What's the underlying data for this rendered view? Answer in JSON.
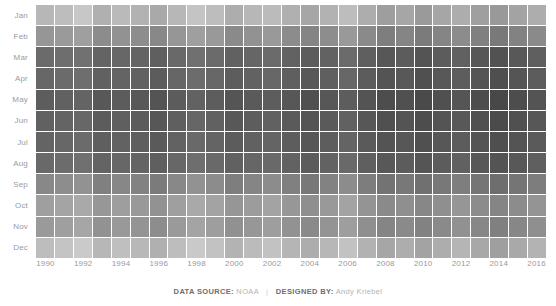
{
  "footer": {
    "source_label": "DATA SOURCE:",
    "source_value": "NOAA",
    "separator": "|",
    "designer_label": "DESIGNED BY:",
    "designer_value": "Andy Kriebel"
  },
  "colors": {
    "background": "#ffffff",
    "grid_line": "#ffffff",
    "axis_text": "#9a9a9a",
    "footer_label": "#6e6e6e",
    "footer_value": "#b4b4b4",
    "scale_light": "#e4e4e4",
    "scale_dark": "#464646"
  },
  "chart_data": {
    "type": "heatmap",
    "title": "",
    "subtitle": "",
    "xlabel": "",
    "ylabel": "",
    "grid": false,
    "legend": "none",
    "colorscale": {
      "description": "grayscale: light = cooler, dark = warmer",
      "min_color": "#e8e8e8",
      "max_color": "#434343",
      "vmin": 0,
      "vmax": 100
    },
    "x": [
      1990,
      1991,
      1992,
      1993,
      1994,
      1995,
      1996,
      1997,
      1998,
      1999,
      2000,
      2001,
      2002,
      2003,
      2004,
      2005,
      2006,
      2007,
      2008,
      2009,
      2010,
      2011,
      2012,
      2013,
      2014,
      2015,
      2016
    ],
    "x_tick_labels": [
      "1990",
      "1992",
      "1994",
      "1996",
      "1998",
      "2000",
      "2002",
      "2004",
      "2006",
      "2008",
      "2010",
      "2012",
      "2014",
      "2016"
    ],
    "x_tick_values": [
      1990,
      1992,
      1994,
      1996,
      1998,
      2000,
      2002,
      2004,
      2006,
      2008,
      2010,
      2012,
      2014,
      2016
    ],
    "y": [
      "Jan",
      "Feb",
      "Mar",
      "Apr",
      "May",
      "Jun",
      "Jul",
      "Aug",
      "Sep",
      "Oct",
      "Nov",
      "Dec"
    ],
    "z": [
      [
        30,
        26,
        20,
        34,
        28,
        33,
        38,
        30,
        22,
        26,
        36,
        30,
        27,
        34,
        40,
        33,
        26,
        36,
        45,
        40,
        47,
        40,
        36,
        44,
        48,
        42,
        36
      ],
      [
        50,
        47,
        44,
        56,
        52,
        55,
        58,
        50,
        44,
        48,
        57,
        52,
        48,
        56,
        60,
        55,
        48,
        57,
        64,
        60,
        66,
        60,
        56,
        63,
        67,
        62,
        57
      ],
      [
        76,
        74,
        72,
        80,
        78,
        80,
        83,
        77,
        73,
        76,
        82,
        79,
        76,
        81,
        85,
        81,
        76,
        83,
        88,
        85,
        90,
        85,
        82,
        88,
        91,
        87,
        83
      ],
      [
        78,
        76,
        74,
        82,
        80,
        82,
        85,
        79,
        75,
        78,
        84,
        81,
        78,
        83,
        87,
        83,
        78,
        85,
        90,
        87,
        92,
        87,
        84,
        90,
        93,
        89,
        85
      ],
      [
        84,
        82,
        80,
        87,
        85,
        87,
        90,
        85,
        81,
        84,
        89,
        86,
        84,
        88,
        92,
        88,
        84,
        90,
        94,
        92,
        96,
        92,
        89,
        94,
        97,
        94,
        90
      ],
      [
        82,
        80,
        78,
        85,
        83,
        85,
        88,
        83,
        79,
        82,
        87,
        84,
        82,
        86,
        90,
        86,
        82,
        88,
        92,
        90,
        94,
        90,
        87,
        92,
        95,
        92,
        88
      ],
      [
        80,
        78,
        76,
        83,
        81,
        83,
        86,
        81,
        77,
        80,
        85,
        82,
        80,
        84,
        88,
        84,
        80,
        86,
        90,
        88,
        92,
        88,
        85,
        90,
        93,
        90,
        86
      ],
      [
        77,
        75,
        73,
        80,
        78,
        80,
        83,
        78,
        74,
        77,
        82,
        79,
        77,
        81,
        85,
        81,
        77,
        83,
        87,
        85,
        89,
        85,
        82,
        87,
        90,
        87,
        83
      ],
      [
        58,
        55,
        52,
        63,
        59,
        62,
        66,
        58,
        52,
        56,
        64,
        60,
        56,
        63,
        68,
        62,
        56,
        65,
        71,
        68,
        73,
        68,
        64,
        70,
        74,
        70,
        65
      ],
      [
        44,
        41,
        38,
        49,
        45,
        48,
        52,
        44,
        38,
        42,
        50,
        46,
        42,
        49,
        54,
        48,
        42,
        51,
        57,
        54,
        59,
        54,
        50,
        56,
        60,
        56,
        51
      ],
      [
        47,
        44,
        40,
        52,
        48,
        51,
        55,
        47,
        41,
        45,
        53,
        49,
        45,
        52,
        57,
        51,
        45,
        54,
        60,
        57,
        62,
        57,
        53,
        59,
        63,
        59,
        54
      ],
      [
        26,
        22,
        18,
        30,
        25,
        29,
        34,
        26,
        19,
        23,
        32,
        27,
        23,
        31,
        36,
        30,
        23,
        33,
        40,
        36,
        42,
        36,
        31,
        39,
        44,
        38,
        32
      ]
    ]
  }
}
